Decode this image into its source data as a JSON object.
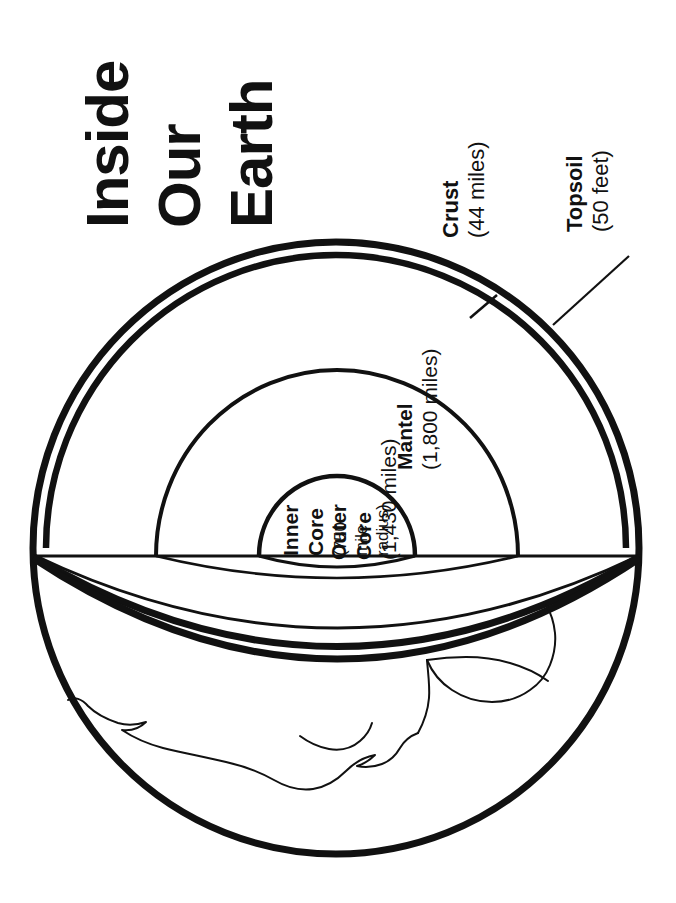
{
  "page": {
    "title_lines": [
      "Inside",
      "Our",
      "Earth"
    ],
    "background_color": "#ffffff",
    "ink_color": "#111111"
  },
  "labels": {
    "crust": {
      "name": "Crust",
      "value": "(44 miles)"
    },
    "topsoil": {
      "name": "Topsoil",
      "value": "(50 feet)"
    },
    "mantel": {
      "name": "Mantel",
      "value": "(1,800 miles)"
    },
    "outer_core": {
      "name_line1": "Outer",
      "name_line2": "Core",
      "value": "(1,430 miles)"
    },
    "inner_core": {
      "name_line1": "Inner",
      "name_line2": "Core",
      "value_line1": "(750",
      "value_line2": "mile",
      "value_line3": "radius)"
    }
  },
  "diagram": {
    "type": "cutaway-cross-section",
    "subject": "Earth",
    "orientation": "rotated-90-counterclockwise",
    "layers": [
      {
        "id": "topsoil",
        "label": "Topsoil",
        "thickness": "50 feet"
      },
      {
        "id": "crust",
        "label": "Crust",
        "thickness": "44 miles"
      },
      {
        "id": "mantel",
        "label": "Mantel",
        "thickness": "1,800 miles"
      },
      {
        "id": "outer-core",
        "label": "Outer Core",
        "thickness": "1,430 miles"
      },
      {
        "id": "inner-core",
        "label": "Inner Core",
        "thickness": "750 mile radius"
      }
    ]
  }
}
